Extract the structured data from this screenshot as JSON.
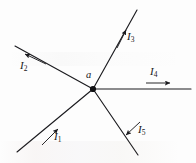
{
  "figure": {
    "kind": "current-junction-diagram",
    "stroke_color": "#1b1b1f",
    "background_color": "#fdfdfd",
    "width": 196,
    "height": 163,
    "node": {
      "label": "a",
      "x": 93,
      "y": 89,
      "dot_radius": 3.1,
      "label_x": 85,
      "label_y": 70
    },
    "branches": [
      {
        "id": "I1",
        "label": "I",
        "subscript": "1",
        "label_x": 54,
        "label_y": 131,
        "line": {
          "x1": 93,
          "y1": 89,
          "x2": 17,
          "y2": 152
        },
        "arrow": {
          "x1": 42,
          "y1": 145,
          "x2": 58,
          "y2": 129,
          "direction": "toward-junction"
        }
      },
      {
        "id": "I2",
        "label": "I",
        "subscript": "2",
        "label_x": 20,
        "label_y": 60,
        "line": {
          "x1": 93,
          "y1": 89,
          "x2": 15,
          "y2": 46
        },
        "arrow": {
          "x1": 46,
          "y1": 64,
          "x2": 25,
          "y2": 54,
          "direction": "away-from-junction"
        }
      },
      {
        "id": "I3",
        "label": "I",
        "subscript": "3",
        "label_x": 127,
        "label_y": 31,
        "line": {
          "x1": 93,
          "y1": 89,
          "x2": 137,
          "y2": 10
        },
        "arrow": {
          "x1": 117,
          "y1": 48,
          "x2": 126,
          "y2": 30,
          "direction": "away-from-junction"
        }
      },
      {
        "id": "I4",
        "label": "I",
        "subscript": "4",
        "label_x": 150,
        "label_y": 66,
        "line": {
          "x1": 93,
          "y1": 89,
          "x2": 191,
          "y2": 89
        },
        "arrow": {
          "x1": 146,
          "y1": 83,
          "x2": 170,
          "y2": 83,
          "direction": "away-from-junction"
        }
      },
      {
        "id": "I5",
        "label": "I",
        "subscript": "5",
        "label_x": 138,
        "label_y": 124,
        "line": {
          "x1": 93,
          "y1": 89,
          "x2": 138,
          "y2": 155
        },
        "arrow": {
          "x1": 140,
          "y1": 122,
          "x2": 126,
          "y2": 135,
          "direction": "toward-junction"
        }
      }
    ]
  }
}
